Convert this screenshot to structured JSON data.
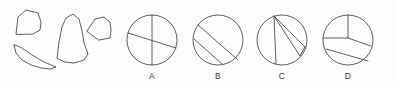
{
  "canvas": {
    "width": 395,
    "height": 86,
    "background_color": "#fdfdfd",
    "ink_color": "#4a4a4a"
  },
  "figure": {
    "kind": "geometry-dissection-puzzle"
  },
  "fragments": {
    "group_name": "loose-pieces",
    "count": 4,
    "items": [
      {
        "id": "piece-1",
        "name": "quarter-sector-piece",
        "shape": "curved-sided quadrilateral (quarter sector)",
        "points": "16,34 18,17 26,10 38,13 41,22 40,30 33,34",
        "center_x": 28,
        "center_y": 22
      },
      {
        "id": "piece-2",
        "name": "cone-piece",
        "shape": "tall cone / tapered sector",
        "points": "57,58 59,42 62,27 66,18 73,14 79,19 82,31 84,43 88,54 84,60 74,63 65,62",
        "center_x": 72,
        "center_y": 39
      },
      {
        "id": "piece-3",
        "name": "small-sector-piece",
        "shape": "small wedge sector",
        "points": "87,31 95,19 104,17 110,22 111,30 110,38 99,40",
        "center_x": 99,
        "center_y": 28
      },
      {
        "id": "piece-4",
        "name": "crescent-segment-piece",
        "shape": "thin circular segment / crescent",
        "points": "14,45 16,53 22,60 31,65 41,68 50,69 56,67 44,62 32,55 22,48",
        "center_x": 34,
        "center_y": 57
      }
    ]
  },
  "options": {
    "group_name": "answer-choices",
    "count": 4,
    "radius": 25,
    "label_y": 79,
    "items": [
      {
        "id": "option-a",
        "label": "A",
        "cx": 152,
        "cy": 40,
        "division": "vertical diameter plus one slanted chord",
        "lines": [
          {
            "name": "vertical-diameter",
            "x1": 152,
            "y1": 15,
            "x2": 152,
            "y2": 65
          },
          {
            "name": "slanted-chord",
            "x1": 128,
            "y1": 33,
            "x2": 176,
            "y2": 48
          }
        ]
      },
      {
        "id": "option-b",
        "label": "B",
        "cx": 218,
        "cy": 40,
        "division": "two parallel diagonal chords",
        "lines": [
          {
            "name": "upper-diagonal-chord",
            "x1": 198,
            "y1": 25,
            "x2": 238,
            "y2": 60
          },
          {
            "name": "lower-diagonal-chord",
            "x1": 194,
            "y1": 39,
            "x2": 222,
            "y2": 64
          }
        ]
      },
      {
        "id": "option-c",
        "label": "C",
        "cx": 282,
        "cy": 40,
        "division": "three chords radiating from a point near the top of the circle",
        "lines": [
          {
            "name": "apex-chord-left",
            "x1": 274,
            "y1": 16,
            "x2": 276,
            "y2": 64
          },
          {
            "name": "apex-chord-middle",
            "x1": 274,
            "y1": 16,
            "x2": 300,
            "y2": 56
          },
          {
            "name": "apex-chord-right",
            "x1": 274,
            "y1": 16,
            "x2": 305,
            "y2": 47
          },
          {
            "name": "lower-right-chord",
            "x1": 300,
            "y1": 56,
            "x2": 305,
            "y2": 47
          }
        ]
      },
      {
        "id": "option-d",
        "label": "D",
        "cx": 348,
        "cy": 40,
        "division": "two radii from centre plus a lower diagonal chord",
        "lines": [
          {
            "name": "vertical-radius-up",
            "x1": 348,
            "y1": 15,
            "x2": 348,
            "y2": 38
          },
          {
            "name": "horizontal-radius-left",
            "x1": 323,
            "y1": 38,
            "x2": 348,
            "y2": 38
          },
          {
            "name": "diagonal-radius-right",
            "x1": 348,
            "y1": 38,
            "x2": 371,
            "y2": 46
          },
          {
            "name": "lower-diagonal-chord",
            "x1": 326,
            "y1": 49,
            "x2": 368,
            "y2": 61
          }
        ]
      }
    ]
  }
}
